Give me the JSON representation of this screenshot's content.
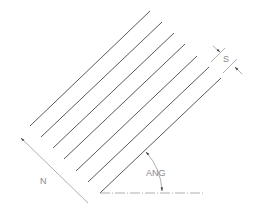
{
  "diagram": {
    "labels": {
      "spacing": "S",
      "count": "N",
      "angle": "ANG"
    },
    "colors": {
      "hatch_line": "#5a5a5a",
      "dimension": "#9a9a9a",
      "text": "#8a8a8a",
      "background": "#ffffff"
    },
    "hatch_lines": [
      {
        "x1": 30,
        "y1": 126,
        "x2": 150,
        "y2": 11
      },
      {
        "x1": 41,
        "y1": 137,
        "x2": 162,
        "y2": 22
      },
      {
        "x1": 53,
        "y1": 148,
        "x2": 174,
        "y2": 33
      },
      {
        "x1": 64,
        "y1": 159,
        "x2": 185,
        "y2": 44
      },
      {
        "x1": 76,
        "y1": 171,
        "x2": 197,
        "y2": 56
      },
      {
        "x1": 88,
        "y1": 182,
        "x2": 209,
        "y2": 67
      },
      {
        "x1": 100,
        "y1": 193,
        "x2": 221,
        "y2": 78
      }
    ]
  }
}
